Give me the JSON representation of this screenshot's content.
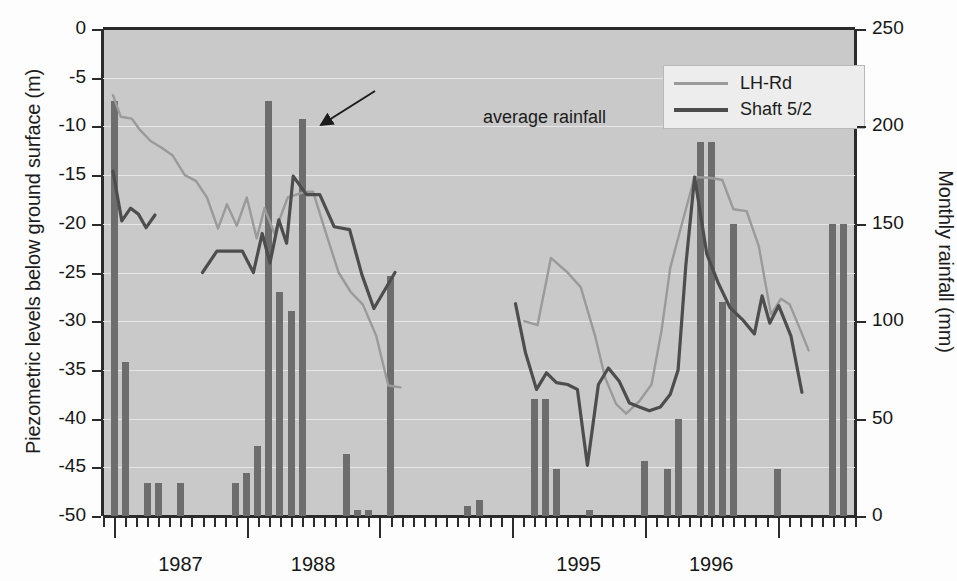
{
  "axes": {
    "left_title": "Piezometric levels below ground surface (m)",
    "right_title": "Monthly rainfall (mm)",
    "left_ticks": [
      "0",
      "-5",
      "-10",
      "-15",
      "-20",
      "-25",
      "-30",
      "-35",
      "-40",
      "-45",
      "-50"
    ],
    "right_ticks": [
      "250",
      "200",
      "150",
      "100",
      "50",
      "0"
    ],
    "x_labels": [
      "1987",
      "1988",
      "1995",
      "1996"
    ]
  },
  "legend": {
    "items": [
      {
        "label": "LH-Rd",
        "color": "#9a9a9a"
      },
      {
        "label": "Shaft 5/2",
        "color": "#4d4d4d"
      }
    ]
  },
  "annotation": {
    "text": "average rainfall"
  },
  "colors": {
    "plot_background": "#c9c9c9",
    "bar": "#6d6d6d",
    "gridline": "#e6e6e6",
    "axis": "#2b2b2b",
    "lh_rd_line": "#9a9a9a",
    "shaft_line": "#4d4d4d"
  },
  "chart_data": {
    "type": "bar",
    "title": "",
    "xlabel": "",
    "ylabel": "Piezometric levels below ground surface (m)",
    "y2label": "Monthly rainfall (mm)",
    "ylim": [
      -50,
      0
    ],
    "y2lim": [
      0,
      250
    ],
    "grid": true,
    "legend_position": "top-right",
    "x_tick_labels": [
      "1987",
      "1988",
      "1995",
      "1996"
    ],
    "x_axis_note": "Monthly minor ticks; major ticks at year boundaries; a break in the record between 1988/89 and 1994/95",
    "bars": {
      "name": "Monthly rainfall",
      "unit": "mm",
      "axis": "right",
      "points": [
        {
          "month_index": 1,
          "value": 213
        },
        {
          "month_index": 2,
          "value": 79
        },
        {
          "month_index": 4,
          "value": 17
        },
        {
          "month_index": 5,
          "value": 17
        },
        {
          "month_index": 7,
          "value": 17
        },
        {
          "month_index": 12,
          "value": 17
        },
        {
          "month_index": 13,
          "value": 22
        },
        {
          "month_index": 14,
          "value": 36
        },
        {
          "month_index": 15,
          "value": 213
        },
        {
          "month_index": 16,
          "value": 115
        },
        {
          "month_index": 17,
          "value": 105
        },
        {
          "month_index": 18,
          "value": 204
        },
        {
          "month_index": 22,
          "value": 32
        },
        {
          "month_index": 23,
          "value": 3
        },
        {
          "month_index": 24,
          "value": 3
        },
        {
          "month_index": 26,
          "value": 123
        },
        {
          "month_index": 33,
          "value": 5
        },
        {
          "month_index": 34,
          "value": 8
        },
        {
          "month_index": 39,
          "value": 60
        },
        {
          "month_index": 40,
          "value": 60
        },
        {
          "month_index": 41,
          "value": 24
        },
        {
          "month_index": 44,
          "value": 3
        },
        {
          "month_index": 49,
          "value": 28
        },
        {
          "month_index": 51,
          "value": 24
        },
        {
          "month_index": 52,
          "value": 50
        },
        {
          "month_index": 54,
          "value": 192
        },
        {
          "month_index": 55,
          "value": 192
        },
        {
          "month_index": 56,
          "value": 110
        },
        {
          "month_index": 57,
          "value": 150
        },
        {
          "month_index": 61,
          "value": 24
        },
        {
          "month_index": 66,
          "value": 150
        },
        {
          "month_index": 67,
          "value": 150
        }
      ]
    },
    "series": [
      {
        "name": "LH-Rd",
        "unit": "m",
        "axis": "left",
        "color": "#9a9a9a",
        "points": [
          {
            "month_index": 0.9,
            "value": -6.8
          },
          {
            "month_index": 1.6,
            "value": -9.0
          },
          {
            "month_index": 2.6,
            "value": -9.2
          },
          {
            "month_index": 3.3,
            "value": -10.3
          },
          {
            "month_index": 4.3,
            "value": -11.5
          },
          {
            "month_index": 5.3,
            "value": -12.2
          },
          {
            "month_index": 6.3,
            "value": -13.0
          },
          {
            "month_index": 7.4,
            "value": -15.0
          },
          {
            "month_index": 8.4,
            "value": -15.6
          },
          {
            "month_index": 9.4,
            "value": -17.3
          },
          {
            "month_index": 10.4,
            "value": -20.5
          },
          {
            "month_index": 11.2,
            "value": -18.0
          },
          {
            "month_index": 12.1,
            "value": -20.2
          },
          {
            "month_index": 13.0,
            "value": -17.3
          },
          {
            "month_index": 13.9,
            "value": -21.5
          },
          {
            "month_index": 14.6,
            "value": -18.4
          },
          {
            "month_index": 15.5,
            "value": -21.0
          },
          {
            "month_index": 16.7,
            "value": -17.3
          },
          {
            "month_index": 18.3,
            "value": -16.7
          },
          {
            "month_index": 19.0,
            "value": -16.7
          },
          {
            "month_index": 20.0,
            "value": -20.4
          },
          {
            "month_index": 21.3,
            "value": -25.0
          },
          {
            "month_index": 22.4,
            "value": -27.0
          },
          {
            "month_index": 23.5,
            "value": -28.3
          },
          {
            "month_index": 24.7,
            "value": -31.5
          },
          {
            "month_index": 25.8,
            "value": -36.6
          },
          {
            "month_index": 26.9,
            "value": -36.8
          },
          {
            "month_index": 38.1,
            "value": -30.0
          },
          {
            "month_index": 39.3,
            "value": -30.4
          },
          {
            "month_index": 40.5,
            "value": -23.5
          },
          {
            "month_index": 42.0,
            "value": -25.0
          },
          {
            "month_index": 43.2,
            "value": -26.5
          },
          {
            "month_index": 44.5,
            "value": -31.5
          },
          {
            "month_index": 45.4,
            "value": -35.8
          },
          {
            "month_index": 46.4,
            "value": -38.5
          },
          {
            "month_index": 47.3,
            "value": -39.5
          },
          {
            "month_index": 48.5,
            "value": -38.2
          },
          {
            "month_index": 49.6,
            "value": -36.5
          },
          {
            "month_index": 50.5,
            "value": -31.0
          },
          {
            "month_index": 51.3,
            "value": -24.5
          },
          {
            "month_index": 52.3,
            "value": -20.2
          },
          {
            "month_index": 53.5,
            "value": -15.2
          },
          {
            "month_index": 55.0,
            "value": -15.3
          },
          {
            "month_index": 56.0,
            "value": -15.5
          },
          {
            "month_index": 57.0,
            "value": -18.5
          },
          {
            "month_index": 58.2,
            "value": -18.7
          },
          {
            "month_index": 59.3,
            "value": -22.3
          },
          {
            "month_index": 60.4,
            "value": -29.3
          },
          {
            "month_index": 61.3,
            "value": -27.7
          },
          {
            "month_index": 62.1,
            "value": -28.3
          },
          {
            "month_index": 63.1,
            "value": -31.0
          },
          {
            "month_index": 63.8,
            "value": -33.0
          }
        ]
      },
      {
        "name": "Shaft 5/2",
        "unit": "m",
        "axis": "left",
        "color": "#4d4d4d",
        "points": [
          {
            "month_index": 0.9,
            "value": -14.6
          },
          {
            "month_index": 1.7,
            "value": -19.7
          },
          {
            "month_index": 2.5,
            "value": -18.4
          },
          {
            "month_index": 3.2,
            "value": -19.0
          },
          {
            "month_index": 3.9,
            "value": -20.4
          },
          {
            "month_index": 4.7,
            "value": -19.1
          },
          {
            "month_index": 9.0,
            "value": -25.0
          },
          {
            "month_index": 10.3,
            "value": -22.8
          },
          {
            "month_index": 12.6,
            "value": -22.8
          },
          {
            "month_index": 13.6,
            "value": -25.0
          },
          {
            "month_index": 14.4,
            "value": -21.0
          },
          {
            "month_index": 15.1,
            "value": -24.0
          },
          {
            "month_index": 15.9,
            "value": -19.6
          },
          {
            "month_index": 16.6,
            "value": -22.0
          },
          {
            "month_index": 17.2,
            "value": -15.1
          },
          {
            "month_index": 18.4,
            "value": -17.0
          },
          {
            "month_index": 19.6,
            "value": -17.0
          },
          {
            "month_index": 20.9,
            "value": -20.3
          },
          {
            "month_index": 22.3,
            "value": -20.6
          },
          {
            "month_index": 23.4,
            "value": -25.2
          },
          {
            "month_index": 24.5,
            "value": -28.7
          },
          {
            "month_index": 26.4,
            "value": -25.0
          },
          {
            "month_index": 37.3,
            "value": -28.2
          },
          {
            "month_index": 38.2,
            "value": -33.2
          },
          {
            "month_index": 39.2,
            "value": -37.0
          },
          {
            "month_index": 40.1,
            "value": -35.3
          },
          {
            "month_index": 41.0,
            "value": -36.3
          },
          {
            "month_index": 42.0,
            "value": -36.5
          },
          {
            "month_index": 42.9,
            "value": -37.0
          },
          {
            "month_index": 43.8,
            "value": -44.8
          },
          {
            "month_index": 44.8,
            "value": -36.5
          },
          {
            "month_index": 45.7,
            "value": -34.8
          },
          {
            "month_index": 46.7,
            "value": -36.2
          },
          {
            "month_index": 47.6,
            "value": -38.4
          },
          {
            "month_index": 48.5,
            "value": -38.8
          },
          {
            "month_index": 49.4,
            "value": -39.2
          },
          {
            "month_index": 50.4,
            "value": -38.8
          },
          {
            "month_index": 51.3,
            "value": -37.5
          },
          {
            "month_index": 52.0,
            "value": -35.0
          },
          {
            "month_index": 52.7,
            "value": -24.3
          },
          {
            "month_index": 53.5,
            "value": -15.2
          },
          {
            "month_index": 54.6,
            "value": -23.1
          },
          {
            "month_index": 55.6,
            "value": -26.0
          },
          {
            "month_index": 56.7,
            "value": -28.6
          },
          {
            "month_index": 57.8,
            "value": -29.8
          },
          {
            "month_index": 58.9,
            "value": -31.3
          },
          {
            "month_index": 59.6,
            "value": -27.4
          },
          {
            "month_index": 60.3,
            "value": -30.2
          },
          {
            "month_index": 61.1,
            "value": -28.4
          },
          {
            "month_index": 62.2,
            "value": -31.5
          },
          {
            "month_index": 63.2,
            "value": -37.3
          }
        ]
      }
    ]
  }
}
